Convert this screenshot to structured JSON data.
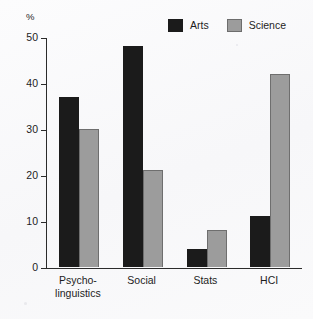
{
  "chart_data": {
    "type": "bar",
    "title": "",
    "subtitle": "",
    "xlabel": "",
    "ylabel": "%",
    "ylim": [
      0,
      50
    ],
    "yticks": [
      0,
      10,
      20,
      30,
      40,
      50
    ],
    "grid": false,
    "legend_position": "top-right",
    "categories": [
      "Psycho-\nlinguistics",
      "Social",
      "Stats",
      "HCI"
    ],
    "category_labels_flat": [
      "Psycho-linguistics",
      "Social",
      "Stats",
      "HCI"
    ],
    "series": [
      {
        "name": "Arts",
        "color": "#1b1b1b",
        "values": [
          37,
          48,
          4,
          11
        ]
      },
      {
        "name": "Science",
        "color": "#9c9c9c",
        "values": [
          30,
          21,
          8,
          42
        ]
      }
    ]
  },
  "axis": {
    "unit_label": "%",
    "tick_labels": [
      "50",
      "40",
      "30",
      "20",
      "10",
      "0"
    ]
  },
  "legend": {
    "items": [
      {
        "label": "Arts",
        "swatch": "legend-swatch-arts"
      },
      {
        "label": "Science",
        "swatch": "legend-swatch-science"
      }
    ]
  },
  "colors": {
    "arts": "#1b1b1b",
    "science": "#9c9c9c",
    "science_border": "#6e6e6e",
    "axis": "#2b2b2b",
    "text": "#1d1d1d",
    "background": "#fbfbfc"
  }
}
